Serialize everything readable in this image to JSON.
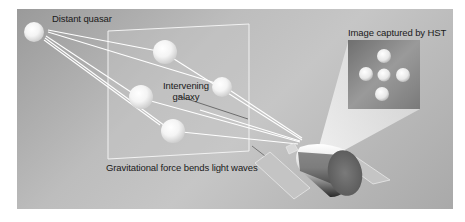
{
  "diagram": {
    "labels": {
      "source": "Distant quasar",
      "lens": "Intervening galaxy",
      "lens_line1": "Intervening",
      "lens_line2": "galaxy",
      "caption": "Gravitational force bends light waves",
      "inset_title": "Image captured by HST"
    },
    "colors": {
      "panel": "#b8b8b8",
      "light_ray": "#ffffff",
      "inset_bg": "#8a8a8a",
      "telescope_end": "#6e6e6e"
    },
    "elements": {
      "quasar": "Distant quasar sphere",
      "lens_plane": "Galaxy plane rectangle with 5 lensed images",
      "telescope": "Hubble Space Telescope with solar panels",
      "inset": "Einstein cross image (5 points)"
    }
  }
}
